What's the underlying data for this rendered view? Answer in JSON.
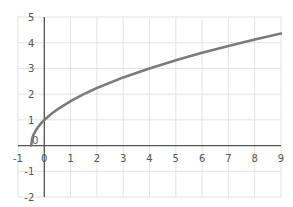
{
  "chart_data": {
    "type": "line",
    "title": "",
    "xlabel": "",
    "ylabel": "",
    "function": "y = sqrt(2x + 1)",
    "xlim": [
      -1,
      9
    ],
    "ylim": [
      -2,
      5
    ],
    "grid": true,
    "legend": null,
    "x_ticks": [
      -1,
      0,
      1,
      2,
      3,
      4,
      5,
      6,
      7,
      8,
      9
    ],
    "y_ticks": [
      -2,
      -1,
      0,
      1,
      2,
      3,
      4,
      5
    ],
    "x_tick_labels": [
      "-1",
      "0",
      "1",
      "2",
      "3",
      "4",
      "5",
      "6",
      "7",
      "8",
      "9"
    ],
    "y_tick_labels": [
      "-2",
      "-1",
      "0",
      "1",
      "2",
      "3",
      "4",
      "5"
    ],
    "series": [
      {
        "name": "curve",
        "color": "#7b7b7b",
        "x": [
          -0.5,
          -0.45,
          -0.4,
          -0.3,
          -0.2,
          -0.1,
          0,
          0.25,
          0.5,
          1,
          1.5,
          2,
          3,
          4,
          5,
          6,
          7,
          8,
          9
        ],
        "y": [
          0,
          0.32,
          0.45,
          0.63,
          0.77,
          0.89,
          1,
          1.22,
          1.41,
          1.73,
          2,
          2.24,
          2.65,
          3,
          3.32,
          3.61,
          3.87,
          4.12,
          4.36
        ]
      }
    ]
  },
  "layout": {
    "x0_px": 18,
    "x1_px": 281,
    "y_top_px": 17,
    "y_bottom_px": 197,
    "colors": {
      "grid": "#e2e2e2",
      "axis": "#555555",
      "curve": "#7b7b7b",
      "label": "#555555"
    }
  }
}
